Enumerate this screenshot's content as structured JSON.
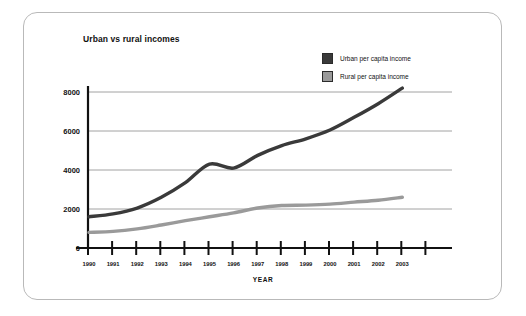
{
  "chart_data": {
    "type": "line",
    "title": "Urban vs rural incomes",
    "xlabel": "YEAR",
    "ylabel": "",
    "grid": true,
    "legend_position": "top-right",
    "ylim": [
      0,
      8800
    ],
    "yticks": [
      "0",
      "2000",
      "4000",
      "6000",
      "8000"
    ],
    "ytick_values": [
      0,
      2000,
      4000,
      6000,
      8000
    ],
    "categories": [
      "1990",
      "1991",
      "1992",
      "1993",
      "1994",
      "1995",
      "1996",
      "1997",
      "1998",
      "1999",
      "2000",
      "2001",
      "2002",
      "2003"
    ],
    "series": [
      {
        "name": "Urban per capita income",
        "color": "#3a3a3a",
        "values": [
          1600,
          1750,
          2050,
          2600,
          3350,
          4300,
          4100,
          4750,
          5250,
          5600,
          6050,
          6700,
          7400,
          8200
        ]
      },
      {
        "name": "Rural per capita income",
        "color": "#9a9a9a",
        "values": [
          800,
          850,
          980,
          1180,
          1400,
          1600,
          1800,
          2050,
          2180,
          2200,
          2250,
          2350,
          2450,
          2600
        ]
      }
    ]
  },
  "axes": {
    "xaxis_title": "YEAR"
  },
  "colors": {
    "urban": "#3a3a3a",
    "rural": "#9a9a9a",
    "gridline": "#8c8c8c",
    "axis": "#111111",
    "frame": "#b9b9b9"
  }
}
